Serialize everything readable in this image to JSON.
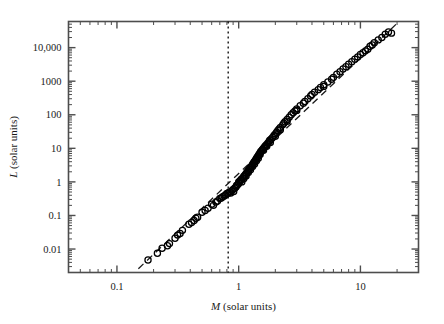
{
  "figure": {
    "background_color": "#ffffff",
    "marker_color": "#000000",
    "axis_color": "#4d4d4d"
  },
  "chart_data": {
    "type": "scatter",
    "title": "",
    "subtitle": "",
    "xlabel": "M (solar units)",
    "xlabel_symbol": "M",
    "xlabel_rest": " (solar units)",
    "ylabel": "L (solar units)",
    "ylabel_symbol": "L",
    "ylabel_rest": " (solar units)",
    "xscale": "log",
    "yscale": "log",
    "xlim": [
      0.04,
      30
    ],
    "ylim": [
      0.002,
      60000
    ],
    "grid": false,
    "legend": null,
    "xticks": [
      0.1,
      1,
      10
    ],
    "xticklabels": [
      "0.1",
      "1",
      "10"
    ],
    "yticks": [
      0.01,
      0.1,
      1,
      10,
      100,
      1000,
      10000
    ],
    "yticklabels": [
      "0.01",
      "0.1",
      "1",
      "10",
      "100",
      "1000",
      "10,000"
    ],
    "marker": "open-circle",
    "marker_size_px": 4.0,
    "annotations": [
      {
        "name": "mass-luminosity-fit-line",
        "type": "dashed-line",
        "style": "dashed",
        "description": "mass-luminosity power-law fit",
        "x": [
          0.15,
          20
        ],
        "y": [
          0.0026,
          53000
        ]
      },
      {
        "name": "lower-mass-limit-line",
        "type": "vertical-dotted-line",
        "style": "dotted",
        "description": "vertical reference line near 0.8 solar masses",
        "x": 0.82
      }
    ],
    "series": [
      {
        "name": "stars",
        "marker": "open-circle",
        "points": [
          [
            0.18,
            0.0047
          ],
          [
            0.215,
            0.0075
          ],
          [
            0.235,
            0.0105
          ],
          [
            0.26,
            0.0125
          ],
          [
            0.27,
            0.0145
          ],
          [
            0.3,
            0.021
          ],
          [
            0.315,
            0.026
          ],
          [
            0.33,
            0.029
          ],
          [
            0.345,
            0.036
          ],
          [
            0.39,
            0.055
          ],
          [
            0.41,
            0.062
          ],
          [
            0.43,
            0.071
          ],
          [
            0.445,
            0.083
          ],
          [
            0.46,
            0.088
          ],
          [
            0.5,
            0.125
          ],
          [
            0.53,
            0.14
          ],
          [
            0.56,
            0.165
          ],
          [
            0.6,
            0.215
          ],
          [
            0.62,
            0.2
          ],
          [
            0.65,
            0.25
          ],
          [
            0.67,
            0.27
          ],
          [
            0.7,
            0.32
          ],
          [
            0.72,
            0.33
          ],
          [
            0.74,
            0.36
          ],
          [
            0.76,
            0.38
          ],
          [
            0.78,
            0.41
          ],
          [
            0.8,
            0.45
          ],
          [
            0.82,
            0.46
          ],
          [
            0.84,
            0.5
          ],
          [
            0.86,
            0.47
          ],
          [
            0.88,
            0.55
          ],
          [
            0.9,
            0.6
          ],
          [
            0.91,
            0.52
          ],
          [
            0.93,
            0.66
          ],
          [
            0.95,
            0.7
          ],
          [
            0.96,
            0.78
          ],
          [
            0.98,
            0.82
          ],
          [
            1.0,
            0.9
          ],
          [
            1.0,
            1.0
          ],
          [
            1.02,
            1.05
          ],
          [
            1.04,
            1.12
          ],
          [
            1.05,
            1.2
          ],
          [
            1.06,
            1.0
          ],
          [
            1.08,
            1.3
          ],
          [
            1.1,
            1.45
          ],
          [
            1.1,
            1.25
          ],
          [
            1.12,
            1.55
          ],
          [
            1.14,
            1.7
          ],
          [
            1.15,
            1.5
          ],
          [
            1.16,
            1.85
          ],
          [
            1.18,
            2.0
          ],
          [
            1.2,
            2.2
          ],
          [
            1.2,
            1.9
          ],
          [
            1.22,
            2.4
          ],
          [
            1.24,
            2.6
          ],
          [
            1.25,
            2.3
          ],
          [
            1.26,
            2.8
          ],
          [
            1.28,
            3.0
          ],
          [
            1.3,
            3.3
          ],
          [
            1.3,
            2.9
          ],
          [
            1.32,
            3.6
          ],
          [
            1.34,
            3.9
          ],
          [
            1.35,
            3.4
          ],
          [
            1.36,
            4.2
          ],
          [
            1.38,
            4.6
          ],
          [
            1.4,
            5.0
          ],
          [
            1.4,
            4.3
          ],
          [
            1.42,
            5.4
          ],
          [
            1.44,
            5.8
          ],
          [
            1.45,
            5.1
          ],
          [
            1.46,
            6.3
          ],
          [
            1.48,
            6.8
          ],
          [
            1.5,
            7.4
          ],
          [
            1.5,
            6.5
          ],
          [
            1.52,
            8.0
          ],
          [
            1.55,
            8.6
          ],
          [
            1.57,
            9.3
          ],
          [
            1.6,
            10.0
          ],
          [
            1.6,
            8.8
          ],
          [
            1.63,
            11.0
          ],
          [
            1.66,
            12.0
          ],
          [
            1.7,
            13.0
          ],
          [
            1.7,
            11.5
          ],
          [
            1.74,
            14.5
          ],
          [
            1.78,
            16.0
          ],
          [
            1.8,
            17.5
          ],
          [
            1.82,
            15.0
          ],
          [
            1.85,
            19.0
          ],
          [
            1.9,
            21.0
          ],
          [
            1.95,
            24.0
          ],
          [
            2.0,
            27.0
          ],
          [
            2.0,
            23.0
          ],
          [
            2.05,
            30.0
          ],
          [
            2.1,
            34.0
          ],
          [
            2.15,
            38.0
          ],
          [
            2.2,
            42.0
          ],
          [
            2.2,
            36.0
          ],
          [
            2.3,
            50.0
          ],
          [
            2.35,
            56.0
          ],
          [
            2.4,
            62.0
          ],
          [
            2.5,
            72.0
          ],
          [
            2.5,
            64.0
          ],
          [
            2.6,
            85.0
          ],
          [
            2.7,
            100.0
          ],
          [
            2.8,
            115.0
          ],
          [
            2.9,
            130.0
          ],
          [
            3.0,
            150.0
          ],
          [
            3.0,
            135.0
          ],
          [
            3.2,
            185.0
          ],
          [
            3.4,
            220.0
          ],
          [
            3.5,
            250.0
          ],
          [
            3.7,
            300.0
          ],
          [
            3.9,
            360.0
          ],
          [
            4.0,
            400.0
          ],
          [
            4.2,
            470.0
          ],
          [
            4.5,
            560.0
          ],
          [
            4.7,
            650.0
          ],
          [
            5.0,
            780.0
          ],
          [
            5.0,
            700.0
          ],
          [
            5.4,
            950.0
          ],
          [
            5.8,
            1150.0
          ],
          [
            6.0,
            1300.0
          ],
          [
            6.4,
            1600.0
          ],
          [
            6.8,
            1900.0
          ],
          [
            7.2,
            2300.0
          ],
          [
            7.6,
            2700.0
          ],
          [
            8.0,
            3200.0
          ],
          [
            8.5,
            3800.0
          ],
          [
            9.0,
            4500.0
          ],
          [
            9.5,
            5300.0
          ],
          [
            10.0,
            6200.0
          ],
          [
            10.5,
            7000.0
          ],
          [
            11.0,
            8000.0
          ],
          [
            11.5,
            9000.0
          ],
          [
            12.0,
            11000.0
          ],
          [
            12.5,
            12000.0
          ],
          [
            13.0,
            14000.0
          ],
          [
            14.0,
            17000.0
          ],
          [
            15.0,
            20000.0
          ],
          [
            16.0,
            25000.0
          ],
          [
            17.0,
            29000.0
          ],
          [
            18.0,
            27000.0
          ]
        ]
      }
    ]
  }
}
